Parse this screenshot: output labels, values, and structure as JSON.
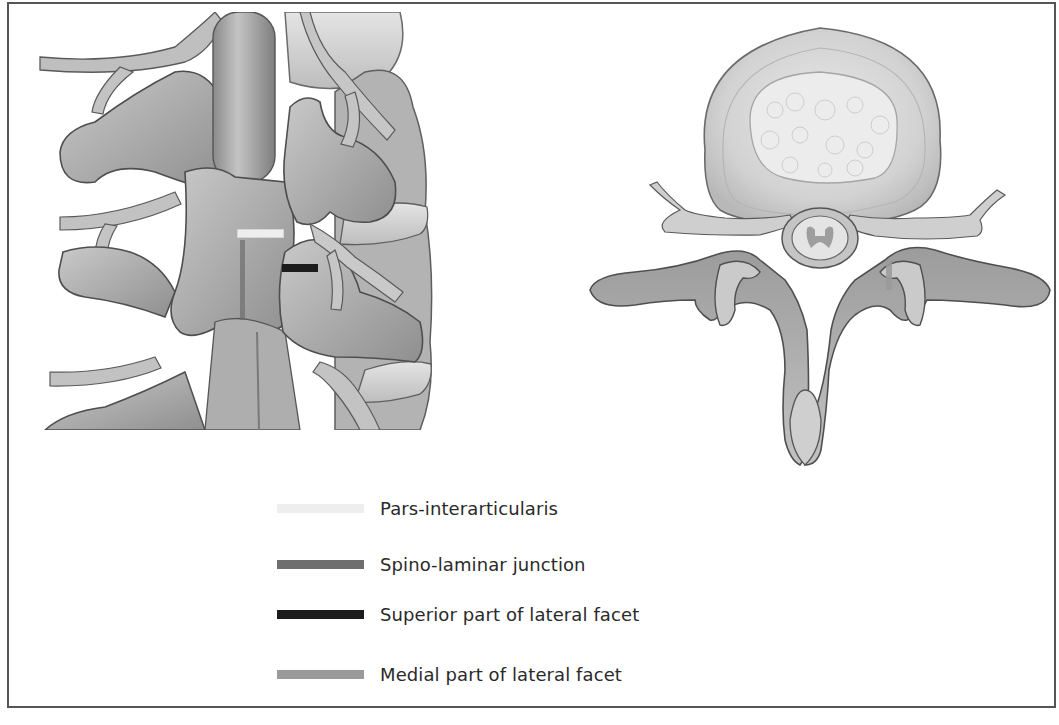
{
  "figure": {
    "left_panel": {
      "view": "posterior view of lumbar spine",
      "markers": [
        {
          "key": "pars",
          "x": 237,
          "y": 232,
          "w": 45,
          "h": 7
        },
        {
          "key": "superior_lateral_facet",
          "x": 282,
          "y": 264,
          "w": 36,
          "h": 8
        },
        {
          "key": "spino_laminar",
          "x": 240,
          "y": 240,
          "w": 5,
          "h": 80
        }
      ]
    },
    "right_panel": {
      "view": "axial view of lumbar vertebra",
      "markers": [
        {
          "key": "medial_lateral_facet",
          "x": 886,
          "y": 260,
          "w": 6,
          "h": 30
        }
      ]
    },
    "legend": {
      "items": [
        {
          "key": "pars",
          "label": "Pars-interarticularis",
          "color": "#eeeeee",
          "top": 0
        },
        {
          "key": "spino_laminar",
          "label": "Spino-laminar junction",
          "color": "#6e6e6e",
          "top": 56
        },
        {
          "key": "superior_lateral_facet",
          "label": "Superior part of lateral facet",
          "color": "#1c1c1c",
          "top": 106
        },
        {
          "key": "medial_lateral_facet",
          "label": "Medial part of lateral facet",
          "color": "#9a9a9a",
          "top": 166
        }
      ]
    }
  }
}
